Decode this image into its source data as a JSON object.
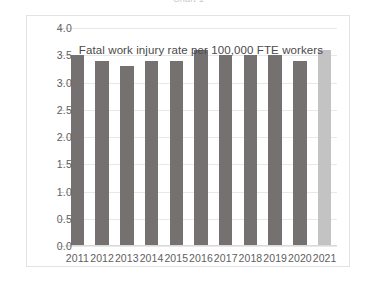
{
  "clipped_header": "Chart 1",
  "chart_data": {
    "type": "bar",
    "title": "Fatal work injury rate per 100,000 FTE workers",
    "xlabel": "",
    "ylabel": "",
    "categories": [
      "2011",
      "2012",
      "2013",
      "2014",
      "2015",
      "2016",
      "2017",
      "2018",
      "2019",
      "2020",
      "2021"
    ],
    "values": [
      3.5,
      3.4,
      3.3,
      3.4,
      3.4,
      3.6,
      3.5,
      3.5,
      3.5,
      3.4,
      3.6
    ],
    "ylim": [
      0.0,
      4.0
    ],
    "ytick_labels": [
      "0.0",
      "0.5",
      "1.0",
      "1.5",
      "2.0",
      "2.5",
      "3.0",
      "3.5",
      "4.0"
    ],
    "ytick_values": [
      0.0,
      0.5,
      1.0,
      1.5,
      2.0,
      2.5,
      3.0,
      3.5,
      4.0
    ],
    "grid": true,
    "legend": null,
    "bar_color": "#767171",
    "highlight_color": "#c3c3c3",
    "highlight_index": 10,
    "axis_text_color": "#5e5e5e",
    "gridline_color": "#e8e8e8",
    "frame_color": "#e3e3e3",
    "background": "#ffffff"
  }
}
